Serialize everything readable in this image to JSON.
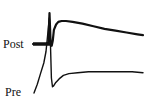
{
  "figure": {
    "type": "electrophysiology-traces",
    "labels": {
      "post": "Post",
      "pre": "Pre"
    },
    "ink_color": "#111111",
    "background_color": "#ffffff"
  },
  "chart_data": {
    "type": "line",
    "title": "",
    "xlabel": "",
    "ylabel": "",
    "grid": false,
    "legend": "none",
    "axes_visible": false,
    "note": "Unscaled schematic traces; values are relative (time 0-100 normalized, amplitude 0-100 normalized; higher = more positive).",
    "xlim": [
      0,
      100
    ],
    "ylim": [
      0,
      100
    ],
    "series": [
      {
        "name": "Post",
        "x": [
          0,
          12,
          14,
          15,
          16,
          17,
          18,
          19,
          21,
          23,
          26,
          30,
          36,
          45,
          55,
          65,
          75,
          85,
          95,
          100
        ],
        "y": [
          60,
          60,
          62,
          95,
          62,
          58,
          64,
          76,
          82,
          85,
          86,
          86,
          85,
          83,
          80,
          77,
          75,
          73,
          71,
          70
        ]
      },
      {
        "name": "Pre",
        "x": [
          0,
          3,
          6,
          9,
          11,
          13,
          14,
          15,
          16,
          17,
          18,
          20,
          23,
          27,
          32,
          40,
          50,
          60,
          70,
          80,
          90,
          100
        ],
        "y": [
          8,
          18,
          30,
          42,
          55,
          80,
          93,
          70,
          25,
          15,
          16,
          20,
          24,
          28,
          30,
          31,
          32,
          32,
          32,
          32,
          32,
          31
        ]
      }
    ]
  }
}
